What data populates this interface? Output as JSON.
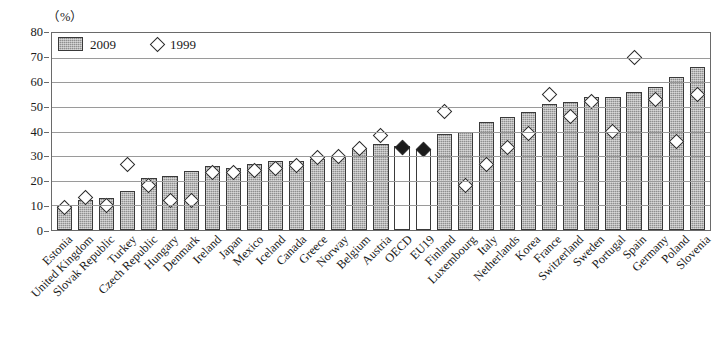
{
  "unit_label": "（%）",
  "legend": {
    "bar_series_label": "2009",
    "marker_series_label": "1999"
  },
  "axis": {
    "y_ticks": [
      0,
      10,
      20,
      30,
      40,
      50,
      60,
      70,
      80
    ]
  },
  "chart_data": {
    "type": "bar",
    "title": "",
    "subtitle": "",
    "xlabel": "",
    "ylabel": "（%）",
    "ylim": [
      0,
      80
    ],
    "grid": true,
    "legend_position": "top-left-inside",
    "categories": [
      "Estonia",
      "United Kingdom",
      "Slovak Republic",
      "Turkey",
      "Czech Republic",
      "Hungary",
      "Denmark",
      "Ireland",
      "Japan",
      "Mexico",
      "Iceland",
      "Canada",
      "Greece",
      "Norway",
      "Belgium",
      "Austria",
      "OECD",
      "EU19",
      "Finland",
      "Luxembourg",
      "Italy",
      "Netherlands",
      "Korea",
      "France",
      "Switzerland",
      "Sweden",
      "Portugal",
      "Spain",
      "Germany",
      "Poland",
      "Slovenia"
    ],
    "series": [
      {
        "name": "2009",
        "type": "bar",
        "values": [
          10,
          12,
          13,
          16,
          21,
          22,
          24,
          26,
          25,
          27,
          28,
          28,
          29,
          30,
          33,
          35,
          34,
          33,
          39,
          40,
          44,
          46,
          48,
          51,
          52,
          54,
          54,
          56,
          58,
          62,
          66
        ],
        "highlight_indices": [
          16,
          17
        ]
      },
      {
        "name": "1999",
        "type": "scatter-diamond",
        "values": [
          9,
          13,
          10,
          26.5,
          18,
          12,
          12,
          23.5,
          23.5,
          24,
          25,
          26,
          29.5,
          30,
          33,
          38.5,
          33.5,
          32.5,
          48,
          18,
          26.5,
          33.5,
          39,
          55,
          46,
          52,
          40,
          70,
          53,
          36,
          55
        ],
        "filled_indices": [
          16,
          17
        ]
      }
    ]
  }
}
